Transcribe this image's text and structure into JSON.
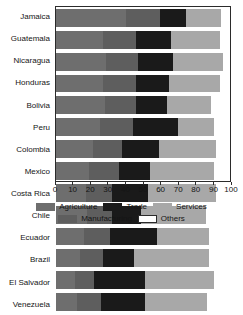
{
  "chart_data": {
    "type": "bar",
    "orientation": "horizontal",
    "stacked": true,
    "title": "",
    "subtitle": "",
    "xlabel": "",
    "ylabel": "",
    "xlim": [
      0,
      100
    ],
    "xticks": [
      0,
      10,
      20,
      30,
      40,
      50,
      60,
      70,
      80,
      90,
      100
    ],
    "xtick_labels": [
      "0",
      "10",
      "20",
      "30",
      "40",
      "50",
      "60",
      "70",
      "80",
      "90",
      "100"
    ],
    "grid": false,
    "legend_position": "bottom",
    "categories": [
      "Jamaica",
      "Guatemala",
      "Nicaragua",
      "Honduras",
      "Bolivia",
      "Peru",
      "Colombia",
      "Mexico",
      "Costa Rica",
      "Chile",
      "Ecuador",
      "Brazil",
      "El Salvador",
      "Venezuela"
    ],
    "series": [
      {
        "name": "Agriculture",
        "color": "#6e6e6e",
        "values": [
          40,
          27,
          29,
          27,
          28,
          25,
          21,
          19,
          17,
          18,
          16,
          14,
          11,
          12
        ]
      },
      {
        "name": "Manufacturing",
        "color": "#5e5e5e",
        "values": [
          20,
          19,
          18,
          19,
          18,
          19,
          17,
          17,
          15,
          14,
          15,
          13,
          11,
          14
        ]
      },
      {
        "name": "Trade",
        "color": "#1a1a1a",
        "values": [
          15,
          20,
          20,
          19,
          18,
          26,
          21,
          18,
          21,
          17,
          27,
          18,
          29,
          25
        ]
      },
      {
        "name": "Services",
        "color": "#a8a8a8",
        "values": [
          20,
          28,
          29,
          29,
          25,
          21,
          33,
          37,
          39,
          37,
          30,
          43,
          40,
          36
        ]
      },
      {
        "name": "Others",
        "color": "#ffffff",
        "values": [
          5,
          6,
          4,
          6,
          11,
          9,
          8,
          9,
          8,
          14,
          12,
          12,
          9,
          13
        ]
      }
    ]
  },
  "legend": {
    "items": [
      {
        "label": "Agriculture",
        "color": "#6e6e6e",
        "bordered": false
      },
      {
        "label": "Trade",
        "color": "#1a1a1a",
        "bordered": false
      },
      {
        "label": "Services",
        "color": "#a8a8a8",
        "bordered": false
      },
      {
        "label": "Manufacturing",
        "color": "#5e5e5e",
        "bordered": false
      },
      {
        "label": "Others",
        "color": "#ffffff",
        "bordered": true
      }
    ],
    "rows": [
      [
        "Agriculture",
        "Trade",
        "Services"
      ],
      [
        "Manufacturing",
        "Others"
      ]
    ]
  },
  "colors": {
    "axis": "#2b2b2b",
    "text": "#151515",
    "background": "#ffffff"
  }
}
